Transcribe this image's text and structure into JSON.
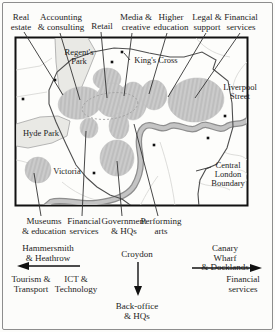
{
  "figure_type": "schematic map of Central London business-service clusters",
  "colors": {
    "cluster_fill": "#cbcbcb",
    "cluster_hatch": "#b9b9b9",
    "river_gray": "#b5b5b5",
    "river_edge": "#8e8e8e",
    "park_fill": "#e9e9e5",
    "boundary_line": "#4f4f4f",
    "map_frame": "#111111",
    "outer_border": "#8d8d8d",
    "text": "#1c1c1c"
  },
  "sector_labels_top": [
    {
      "text": "Real\nestate"
    },
    {
      "text": "Accounting\n& consulting"
    },
    {
      "text": "Retail"
    },
    {
      "text": "Media &\ncreative"
    },
    {
      "text": "Higher\neducation"
    },
    {
      "text": "Legal &\nsupport"
    },
    {
      "text": "Financial\nservices"
    }
  ],
  "sector_labels_bottom": [
    {
      "text": "Museums\n& education"
    },
    {
      "text": "Financial\nservices"
    },
    {
      "text": "Government\n& HQs"
    },
    {
      "text": "Performing\narts"
    }
  ],
  "map_labels": {
    "regents_park": "Regent's\nPark",
    "kings_cross": "King's Cross",
    "liverpool_street": "Liverpool\nStreet",
    "hyde_park": "Hyde Park",
    "victoria": "Victoria",
    "central_boundary": "Central\nLondon\nBoundary"
  },
  "flows": {
    "west": {
      "destination": "Hammersmith\n& Heathrow",
      "direction": "left",
      "sectors": [
        "Tourism &\nTransport",
        "ICT &\nTechnology"
      ]
    },
    "south": {
      "destination": "Croydon",
      "direction": "down",
      "sectors": [
        "Back-office\n& HQs"
      ]
    },
    "east": {
      "destination": "Canary Wharf\n& Docklands",
      "direction": "right",
      "sectors": [
        "Financial\nservices"
      ]
    }
  }
}
